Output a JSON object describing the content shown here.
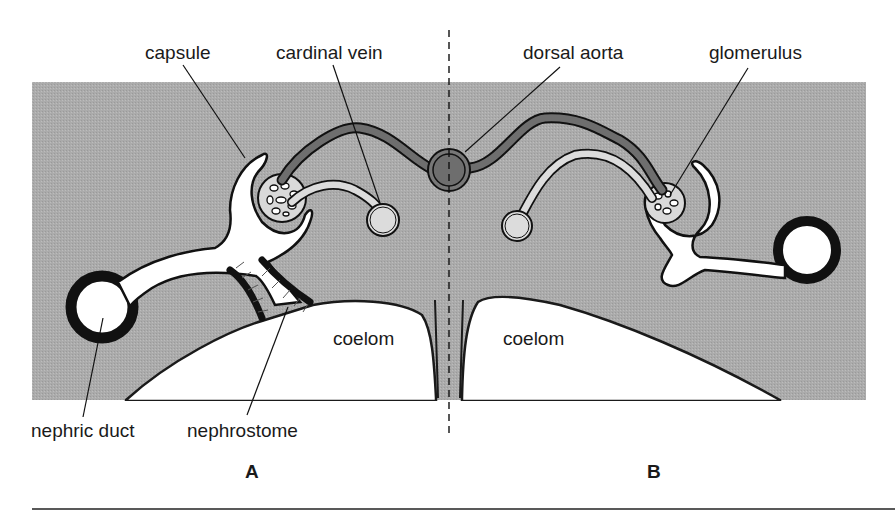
{
  "figure": {
    "labels": {
      "capsule": "capsule",
      "cardinal_vein": "cardinal vein",
      "dorsal_aorta": "dorsal aorta",
      "glomerulus": "glomerulus",
      "nephric_duct": "nephric duct",
      "nephrostome": "nephrostome",
      "coelom_left": "coelom",
      "coelom_right": "coelom"
    },
    "panels": {
      "left": "A",
      "right": "B"
    },
    "colors": {
      "tissue": "#a9a9a9",
      "aorta": "#6e6e6e",
      "vein": "#dcdcdc",
      "lumen": "#ffffff",
      "outline": "#1a1a1a"
    }
  }
}
